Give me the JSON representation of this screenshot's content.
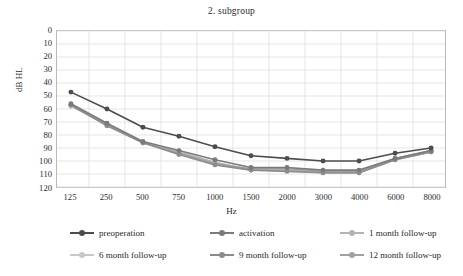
{
  "chart_data": {
    "type": "line",
    "title": "2. subgroup",
    "xlabel": "Hz",
    "ylabel": "dB HL",
    "categories": [
      "125",
      "250",
      "500",
      "750",
      "1000",
      "1500",
      "2000",
      "3000",
      "4000",
      "6000",
      "8000"
    ],
    "ylim": [
      0,
      120
    ],
    "y_inverted": true,
    "y_ticks": [
      "0",
      "10",
      "20",
      "30",
      "40",
      "50",
      "60",
      "70",
      "80",
      "90",
      "100",
      "110",
      "120"
    ],
    "grid": true,
    "legend_position": "bottom",
    "series": [
      {
        "name": "preoperation",
        "color": "#4d4d4d",
        "values": [
          47,
          60,
          74,
          81,
          89,
          96,
          98,
          100,
          100,
          94,
          90
        ]
      },
      {
        "name": "activation",
        "color": "#7a7a7a",
        "values": [
          56,
          71,
          85,
          92,
          99,
          105,
          105,
          107,
          107,
          98,
          92
        ]
      },
      {
        "name": "1 month follow-up",
        "color": "#b4b4b4",
        "values": [
          57,
          72,
          86,
          93,
          101,
          107,
          107,
          109,
          109,
          99,
          93
        ]
      },
      {
        "name": "6 month follow-up",
        "color": "#c8c8c8",
        "values": [
          58,
          72,
          86,
          94,
          102,
          107,
          107,
          109,
          109,
          99,
          93
        ]
      },
      {
        "name": "9 month follow-up",
        "color": "#8c8c8c",
        "values": [
          57,
          73,
          86,
          95,
          103,
          107,
          108,
          109,
          109,
          99,
          93
        ]
      },
      {
        "name": "12 month follow-up",
        "color": "#a0a0a0",
        "values": [
          57,
          72,
          86,
          94,
          102,
          106,
          106,
          108,
          108,
          98,
          92
        ]
      }
    ]
  },
  "legend": {
    "items": [
      {
        "label": "preoperation"
      },
      {
        "label": "activation"
      },
      {
        "label": "1 month follow-up"
      },
      {
        "label": "6 month follow-up"
      },
      {
        "label": "9 month follow-up"
      },
      {
        "label": "12 month follow-up"
      }
    ]
  },
  "style": {
    "grid_color": "#dedede",
    "frame_color": "#b9b9b9",
    "text_color": "#2a2a2a",
    "background": "#ffffff"
  }
}
